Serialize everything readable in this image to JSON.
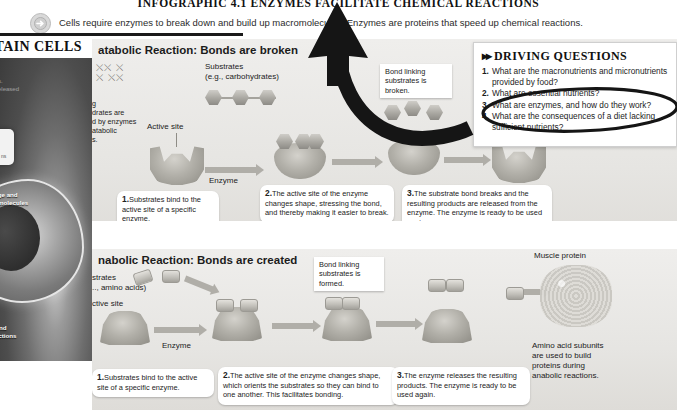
{
  "header": {
    "chapter_title": "INFOGRAPHIC 4.1  ENZYMES FACILITATE CHEMICAL REACTIONS",
    "subtitle": "Cells require enzymes to break down and build up macromolecules. Enzymes are proteins that speed up chemical reactions.",
    "arrow_icon": "arrow-right-circle-icon"
  },
  "left_column": {
    "page_title": "NTAIN CELLS",
    "faint_text": "uids.\nis released",
    "label_storage": "torage and\nace molecules",
    "label_instructions": "g and\ntructions",
    "chip_text": "ns"
  },
  "catabolic": {
    "title": "atabolic Reaction: Bonds are broken",
    "left_note": "g\ndrates are\nd by enzymes\natabolic\ns.",
    "substrates_label": "Substrates\n(e.g., carbohydrates)",
    "active_site_label": "Active site",
    "enzyme_label": "Enzyme",
    "bond_callout": "Bond linking\nsubstrates\nis broken.",
    "steps": [
      {
        "num": "1.",
        "text": "Substrates bind to\nthe active site of a\nspecific enzyme."
      },
      {
        "num": "2.",
        "text": "The active site of the enzyme\nchanges shape, stressing the\nbond, and thereby making it\neasier to break."
      },
      {
        "num": "3.",
        "text": "The substrate bond breaks\nand the resulting products\nare released from the enzyme. The\nenzyme is ready to be  used again."
      }
    ]
  },
  "anabolic": {
    "title": "nabolic Reaction: Bonds are created",
    "substrates_label": "strates\n.., amino acids)",
    "active_site_label": "ctive site",
    "enzyme_label": "Enzyme",
    "bond_callout": "Bond linking\nsubstrates\nis formed.",
    "muscle_protein_label": "Muscle protein",
    "amino_note": "Amino acid subunits\nare used to build\nproteins during\nanabolic reactions.",
    "steps": [
      {
        "num": "1.",
        "text": "Substrates bind to the active\nsite of a specific enzyme."
      },
      {
        "num": "2.",
        "text": "The active site of the enzyme changes shape,\nwhich orients the substrates so they can bind to\none another. This facilitates bonding."
      },
      {
        "num": "3.",
        "text": "The enzyme releases the resulting\nproducts. The enzyme is ready to\nbe used again."
      }
    ]
  },
  "driving_questions": {
    "title": "DRIVING QUESTIONS",
    "chevrons": "▸▸",
    "items": [
      {
        "num": "1.",
        "text": "What are the macronutrients and micronutrients provided by food?"
      },
      {
        "num": "2.",
        "text": "What are essential nutrients?"
      },
      {
        "num": "3.",
        "text": "What are enzymes, and how do they work?"
      },
      {
        "num": "4.",
        "text": "What are the consequences of a diet lacking sufficient nutrients?"
      }
    ]
  },
  "annotations": {
    "arrow_color": "#151515",
    "ellipse_color": "#151515",
    "arrow_name": "hand-drawn-curved-up-arrow",
    "ellipse_name": "hand-drawn-ellipse-highlight-question-3"
  }
}
